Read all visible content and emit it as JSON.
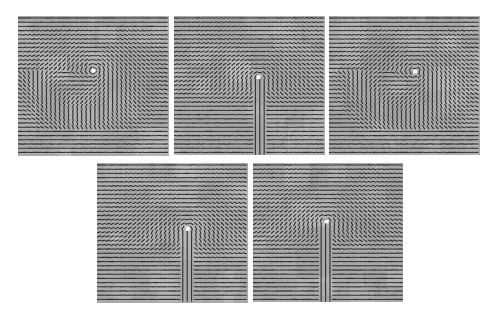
{
  "figure": {
    "panels": [
      {
        "id": "p1",
        "pattern": "whorl",
        "core_marker": "white-square"
      },
      {
        "id": "p2",
        "pattern": "loop",
        "core_marker": "white-square"
      },
      {
        "id": "p3",
        "pattern": "whorl",
        "core_marker": "white-square"
      },
      {
        "id": "p4",
        "pattern": "loop",
        "core_marker": "white-square"
      },
      {
        "id": "p5",
        "pattern": "loop",
        "core_marker": "white-square"
      }
    ]
  },
  "colors": {
    "background": "#ffffff",
    "image_gray": "#a9a9a9",
    "orientation_lines": "#2e2e2e",
    "core_marker": "#ffffff"
  }
}
